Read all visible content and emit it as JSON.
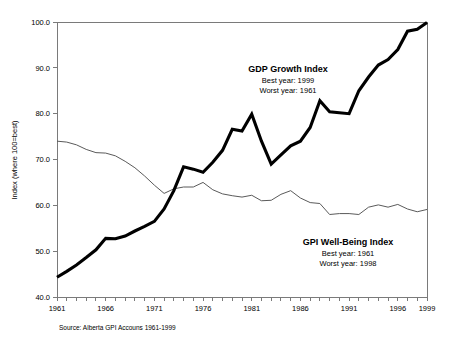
{
  "chart_data": {
    "type": "line",
    "title": "",
    "xlabel": "",
    "ylabel": "Index (where 100=best)",
    "xlim": [
      1961,
      1999
    ],
    "ylim": [
      40.0,
      100.0
    ],
    "grid": false,
    "legend_position": "inline-annotations",
    "x": [
      1961,
      1962,
      1963,
      1964,
      1965,
      1966,
      1967,
      1968,
      1969,
      1970,
      1971,
      1972,
      1973,
      1974,
      1975,
      1976,
      1977,
      1978,
      1979,
      1980,
      1981,
      1982,
      1983,
      1984,
      1985,
      1986,
      1987,
      1988,
      1989,
      1990,
      1991,
      1992,
      1993,
      1994,
      1995,
      1996,
      1997,
      1998,
      1999
    ],
    "xticks": [
      1961,
      1966,
      1971,
      1976,
      1981,
      1986,
      1991,
      1996,
      1999
    ],
    "xticklabels": [
      "1961",
      "1966",
      "1971",
      "1976",
      "1981",
      "1986",
      "1991",
      "1996",
      "1999"
    ],
    "yticks": [
      40.0,
      50.0,
      60.0,
      70.0,
      80.0,
      90.0,
      100.0
    ],
    "yticklabels": [
      "40.0",
      "50.0",
      "60.0",
      "70.0",
      "80.0",
      "90.0",
      "100.0"
    ],
    "series": [
      {
        "name": "GDP Growth Index",
        "style": "thick-black",
        "values": [
          44.3,
          45.6,
          47.0,
          48.6,
          50.3,
          52.8,
          52.7,
          53.3,
          54.4,
          55.4,
          56.5,
          59.2,
          63.2,
          68.4,
          67.9,
          67.2,
          69.4,
          72.0,
          76.6,
          76.2,
          79.9,
          74.0,
          69.0,
          71.0,
          73.0,
          74.0,
          77.0,
          82.8,
          80.4,
          80.2,
          80.0,
          85.0,
          88.0,
          90.6,
          91.8,
          94.0,
          98.0,
          98.4,
          99.9
        ]
      },
      {
        "name": "GPI Well-Being Index",
        "style": "thin-gray",
        "values": [
          74.0,
          73.8,
          73.2,
          72.2,
          71.5,
          71.4,
          70.8,
          69.6,
          68.2,
          66.4,
          64.4,
          62.6,
          63.6,
          64.0,
          64.0,
          65.0,
          63.4,
          62.5,
          62.1,
          61.8,
          62.2,
          61.0,
          61.1,
          62.4,
          63.2,
          61.6,
          60.6,
          60.4,
          58.0,
          58.2,
          58.2,
          58.0,
          59.6,
          60.1,
          59.6,
          60.2,
          59.2,
          58.6,
          59.1
        ]
      }
    ]
  },
  "annotations": {
    "gdp": {
      "title": "GDP Growth Index",
      "best": "Best year: 1999",
      "worst": "Worst year: 1961"
    },
    "gpi": {
      "title": "GPI Well-Being Index",
      "best": "Best year: 1961",
      "worst": "Worst year: 1998"
    }
  },
  "source": {
    "text": "Source: Alberta GPI Accouns 1961-1999"
  },
  "colors": {
    "gdp_line": "#000000",
    "gpi_line": "#5a5a5a",
    "axis": "#7a7a7a",
    "text": "#000000",
    "background": "#ffffff"
  }
}
